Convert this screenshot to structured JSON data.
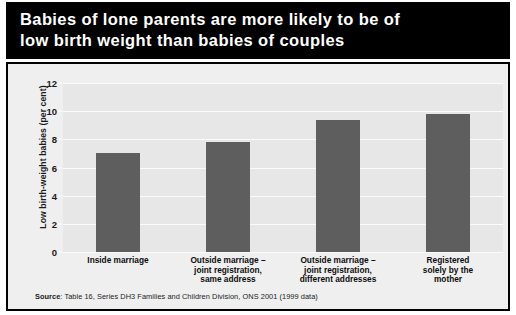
{
  "chart_data": {
    "type": "bar",
    "title": "Babies of lone parents are more likely to be of\nlow birth weight than babies of couples",
    "xlabel": "",
    "ylabel": "Low birth-weight babies (per cent)",
    "categories": [
      "Inside marriage",
      "Outside marriage –\njoint registration,\nsame address",
      "Outside marriage –\njoint registration,\ndifferent addresses",
      "Registered\nsolely by the\nmother"
    ],
    "values": [
      7.0,
      7.8,
      9.4,
      9.8
    ],
    "ylim": [
      0,
      12
    ],
    "yticks": [
      0,
      2,
      4,
      6,
      8,
      10,
      12
    ],
    "ytick_labels": [
      "0",
      "2",
      "4",
      "6",
      "8",
      "10",
      "12"
    ],
    "grid": true,
    "legend": "none",
    "bar_color": "#5e5e5e",
    "plot_background": "#e7e7e7",
    "gridline_color": "#fbfbfb",
    "title_background": "#000000",
    "title_color": "#ffffff"
  },
  "source": {
    "label": "Source",
    "text": ": Table 16, Series DH3 Families and Children Division, ONS 2001 (1999 data)"
  }
}
